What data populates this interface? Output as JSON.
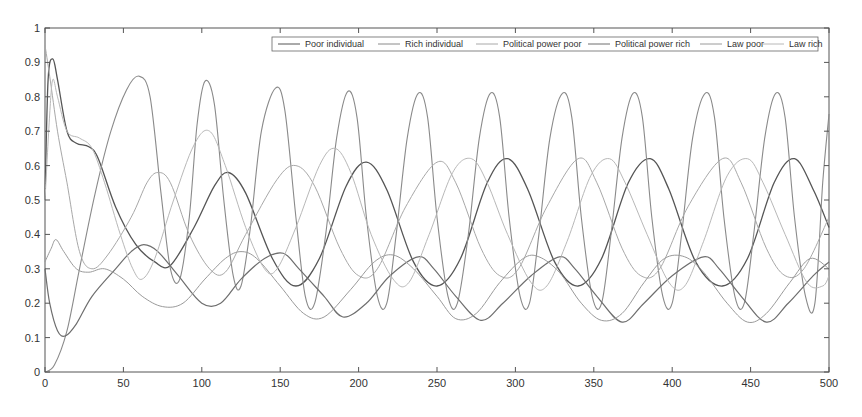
{
  "chart_data": {
    "type": "line",
    "title": "",
    "xlabel": "",
    "ylabel": "",
    "xlim": [
      0,
      500
    ],
    "ylim": [
      0,
      1
    ],
    "x_ticks": [
      0,
      50,
      100,
      150,
      200,
      250,
      300,
      350,
      400,
      450,
      500
    ],
    "y_ticks": [
      0,
      0.1,
      0.2,
      0.3,
      0.4,
      0.5,
      0.6,
      0.7,
      0.8,
      0.9,
      1
    ],
    "grid": false,
    "legend_position": "top-right (horizontal)",
    "series": [
      {
        "name": "Poor individual",
        "color": "#555555",
        "width": 1.3,
        "dash": "",
        "points": [
          [
            0,
            0.5
          ],
          [
            2,
            0.85
          ],
          [
            5,
            0.91
          ],
          [
            8,
            0.85
          ],
          [
            14,
            0.7
          ],
          [
            20,
            0.665
          ],
          [
            28,
            0.655
          ],
          [
            34,
            0.62
          ],
          [
            45,
            0.48
          ],
          [
            58,
            0.37
          ],
          [
            70,
            0.32
          ],
          [
            80,
            0.31
          ],
          [
            95,
            0.42
          ],
          [
            108,
            0.54
          ],
          [
            117,
            0.58
          ],
          [
            128,
            0.52
          ],
          [
            145,
            0.33
          ],
          [
            160,
            0.25
          ],
          [
            175,
            0.33
          ],
          [
            192,
            0.54
          ],
          [
            205,
            0.61
          ],
          [
            218,
            0.53
          ],
          [
            235,
            0.32
          ],
          [
            250,
            0.25
          ],
          [
            265,
            0.33
          ],
          [
            282,
            0.55
          ],
          [
            295,
            0.62
          ],
          [
            308,
            0.53
          ],
          [
            325,
            0.32
          ],
          [
            340,
            0.25
          ],
          [
            355,
            0.33
          ],
          [
            372,
            0.55
          ],
          [
            386,
            0.62
          ],
          [
            398,
            0.53
          ],
          [
            415,
            0.32
          ],
          [
            432,
            0.25
          ],
          [
            448,
            0.33
          ],
          [
            465,
            0.55
          ],
          [
            478,
            0.62
          ],
          [
            490,
            0.53
          ],
          [
            500,
            0.42
          ]
        ]
      },
      {
        "name": "Rich individual",
        "color": "#8a8a8a",
        "width": 1.1,
        "dash": "",
        "points": [
          [
            0,
            0.0
          ],
          [
            6,
            0.02
          ],
          [
            14,
            0.12
          ],
          [
            22,
            0.3
          ],
          [
            32,
            0.52
          ],
          [
            42,
            0.7
          ],
          [
            52,
            0.82
          ],
          [
            60,
            0.86
          ],
          [
            67,
            0.8
          ],
          [
            74,
            0.52
          ],
          [
            80,
            0.3
          ],
          [
            86,
            0.27
          ],
          [
            92,
            0.45
          ],
          [
            97,
            0.72
          ],
          [
            102,
            0.845
          ],
          [
            108,
            0.78
          ],
          [
            114,
            0.5
          ],
          [
            120,
            0.28
          ],
          [
            125,
            0.25
          ],
          [
            131,
            0.42
          ],
          [
            138,
            0.7
          ],
          [
            147,
            0.825
          ],
          [
            153,
            0.76
          ],
          [
            160,
            0.45
          ],
          [
            166,
            0.22
          ],
          [
            172,
            0.2
          ],
          [
            179,
            0.4
          ],
          [
            186,
            0.68
          ],
          [
            193,
            0.815
          ],
          [
            199,
            0.74
          ],
          [
            205,
            0.45
          ],
          [
            212,
            0.22
          ],
          [
            218,
            0.2
          ],
          [
            224,
            0.4
          ],
          [
            231,
            0.68
          ],
          [
            238,
            0.81
          ],
          [
            244,
            0.74
          ],
          [
            250,
            0.45
          ],
          [
            257,
            0.22
          ],
          [
            263,
            0.2
          ],
          [
            270,
            0.4
          ],
          [
            277,
            0.68
          ],
          [
            284,
            0.81
          ],
          [
            290,
            0.74
          ],
          [
            296,
            0.45
          ],
          [
            303,
            0.22
          ],
          [
            309,
            0.2
          ],
          [
            315,
            0.4
          ],
          [
            322,
            0.68
          ],
          [
            330,
            0.81
          ],
          [
            336,
            0.74
          ],
          [
            342,
            0.45
          ],
          [
            349,
            0.22
          ],
          [
            355,
            0.2
          ],
          [
            361,
            0.4
          ],
          [
            368,
            0.68
          ],
          [
            375,
            0.81
          ],
          [
            381,
            0.74
          ],
          [
            387,
            0.45
          ],
          [
            394,
            0.22
          ],
          [
            400,
            0.2
          ],
          [
            406,
            0.4
          ],
          [
            413,
            0.68
          ],
          [
            421,
            0.81
          ],
          [
            427,
            0.74
          ],
          [
            433,
            0.45
          ],
          [
            440,
            0.22
          ],
          [
            446,
            0.2
          ],
          [
            452,
            0.4
          ],
          [
            459,
            0.68
          ],
          [
            466,
            0.81
          ],
          [
            472,
            0.74
          ],
          [
            478,
            0.45
          ],
          [
            485,
            0.22
          ],
          [
            491,
            0.2
          ],
          [
            496,
            0.55
          ],
          [
            500,
            0.75
          ]
        ]
      },
      {
        "name": "Political power poor",
        "color": "#a8a8a8",
        "width": 1.0,
        "dash": "",
        "points": [
          [
            0,
            0.95
          ],
          [
            3,
            0.86
          ],
          [
            8,
            0.7
          ],
          [
            14,
            0.55
          ],
          [
            22,
            0.35
          ],
          [
            30,
            0.3
          ],
          [
            40,
            0.34
          ],
          [
            55,
            0.45
          ],
          [
            65,
            0.55
          ],
          [
            72,
            0.58
          ],
          [
            80,
            0.55
          ],
          [
            92,
            0.4
          ],
          [
            105,
            0.3
          ],
          [
            115,
            0.29
          ],
          [
            128,
            0.4
          ],
          [
            148,
            0.56
          ],
          [
            160,
            0.6
          ],
          [
            172,
            0.54
          ],
          [
            188,
            0.36
          ],
          [
            200,
            0.28
          ],
          [
            212,
            0.3
          ],
          [
            230,
            0.48
          ],
          [
            250,
            0.61
          ],
          [
            262,
            0.55
          ],
          [
            278,
            0.36
          ],
          [
            290,
            0.28
          ],
          [
            302,
            0.3
          ],
          [
            320,
            0.48
          ],
          [
            340,
            0.62
          ],
          [
            352,
            0.55
          ],
          [
            368,
            0.36
          ],
          [
            380,
            0.28
          ],
          [
            392,
            0.3
          ],
          [
            410,
            0.48
          ],
          [
            432,
            0.62
          ],
          [
            444,
            0.55
          ],
          [
            460,
            0.36
          ],
          [
            472,
            0.28
          ],
          [
            484,
            0.3
          ],
          [
            500,
            0.45
          ]
        ]
      },
      {
        "name": "Political power rich",
        "color": "#6e6e6e",
        "width": 1.2,
        "dash": "",
        "points": [
          [
            0,
            0.3
          ],
          [
            3,
            0.2
          ],
          [
            8,
            0.12
          ],
          [
            13,
            0.105
          ],
          [
            20,
            0.14
          ],
          [
            30,
            0.22
          ],
          [
            45,
            0.3
          ],
          [
            55,
            0.35
          ],
          [
            63,
            0.37
          ],
          [
            72,
            0.35
          ],
          [
            85,
            0.28
          ],
          [
            100,
            0.2
          ],
          [
            112,
            0.2
          ],
          [
            125,
            0.27
          ],
          [
            140,
            0.33
          ],
          [
            152,
            0.345
          ],
          [
            162,
            0.3
          ],
          [
            178,
            0.22
          ],
          [
            190,
            0.16
          ],
          [
            205,
            0.2
          ],
          [
            220,
            0.28
          ],
          [
            238,
            0.335
          ],
          [
            248,
            0.3
          ],
          [
            262,
            0.22
          ],
          [
            278,
            0.15
          ],
          [
            292,
            0.2
          ],
          [
            310,
            0.28
          ],
          [
            328,
            0.335
          ],
          [
            338,
            0.3
          ],
          [
            352,
            0.22
          ],
          [
            368,
            0.145
          ],
          [
            382,
            0.2
          ],
          [
            400,
            0.28
          ],
          [
            420,
            0.335
          ],
          [
            430,
            0.3
          ],
          [
            444,
            0.22
          ],
          [
            460,
            0.145
          ],
          [
            474,
            0.2
          ],
          [
            490,
            0.28
          ],
          [
            500,
            0.32
          ]
        ]
      },
      {
        "name": "Law poor",
        "color": "#9a9a9a",
        "width": 1.0,
        "dash": "",
        "points": [
          [
            0,
            0.32
          ],
          [
            4,
            0.36
          ],
          [
            7,
            0.385
          ],
          [
            12,
            0.35
          ],
          [
            20,
            0.3
          ],
          [
            28,
            0.29
          ],
          [
            38,
            0.3
          ],
          [
            50,
            0.27
          ],
          [
            62,
            0.22
          ],
          [
            75,
            0.19
          ],
          [
            88,
            0.2
          ],
          [
            102,
            0.27
          ],
          [
            115,
            0.33
          ],
          [
            125,
            0.35
          ],
          [
            135,
            0.33
          ],
          [
            150,
            0.25
          ],
          [
            165,
            0.17
          ],
          [
            178,
            0.16
          ],
          [
            195,
            0.24
          ],
          [
            210,
            0.32
          ],
          [
            222,
            0.34
          ],
          [
            235,
            0.3
          ],
          [
            250,
            0.22
          ],
          [
            262,
            0.155
          ],
          [
            275,
            0.17
          ],
          [
            290,
            0.26
          ],
          [
            305,
            0.33
          ],
          [
            315,
            0.335
          ],
          [
            328,
            0.29
          ],
          [
            342,
            0.2
          ],
          [
            355,
            0.15
          ],
          [
            368,
            0.17
          ],
          [
            382,
            0.26
          ],
          [
            395,
            0.33
          ],
          [
            408,
            0.335
          ],
          [
            420,
            0.29
          ],
          [
            435,
            0.2
          ],
          [
            448,
            0.145
          ],
          [
            460,
            0.17
          ],
          [
            475,
            0.26
          ],
          [
            488,
            0.33
          ],
          [
            500,
            0.3
          ]
        ]
      },
      {
        "name": "Law rich",
        "color": "#b8b8b8",
        "width": 1.0,
        "dash": "",
        "points": [
          [
            0,
            0.5
          ],
          [
            3,
            0.75
          ],
          [
            5,
            0.85
          ],
          [
            8,
            0.8
          ],
          [
            14,
            0.7
          ],
          [
            22,
            0.68
          ],
          [
            30,
            0.65
          ],
          [
            38,
            0.55
          ],
          [
            48,
            0.4
          ],
          [
            56,
            0.3
          ],
          [
            62,
            0.27
          ],
          [
            70,
            0.33
          ],
          [
            82,
            0.5
          ],
          [
            95,
            0.66
          ],
          [
            105,
            0.7
          ],
          [
            115,
            0.6
          ],
          [
            128,
            0.42
          ],
          [
            140,
            0.3
          ],
          [
            148,
            0.3
          ],
          [
            160,
            0.42
          ],
          [
            175,
            0.6
          ],
          [
            185,
            0.65
          ],
          [
            195,
            0.58
          ],
          [
            208,
            0.4
          ],
          [
            222,
            0.27
          ],
          [
            232,
            0.26
          ],
          [
            245,
            0.4
          ],
          [
            260,
            0.58
          ],
          [
            272,
            0.62
          ],
          [
            282,
            0.55
          ],
          [
            295,
            0.4
          ],
          [
            310,
            0.26
          ],
          [
            320,
            0.25
          ],
          [
            333,
            0.38
          ],
          [
            348,
            0.57
          ],
          [
            360,
            0.62
          ],
          [
            370,
            0.55
          ],
          [
            384,
            0.4
          ],
          [
            398,
            0.26
          ],
          [
            408,
            0.25
          ],
          [
            420,
            0.38
          ],
          [
            435,
            0.57
          ],
          [
            448,
            0.62
          ],
          [
            458,
            0.55
          ],
          [
            472,
            0.4
          ],
          [
            486,
            0.26
          ],
          [
            496,
            0.25
          ],
          [
            500,
            0.28
          ]
        ]
      }
    ]
  },
  "axes": {
    "x_tick_labels": [
      "0",
      "50",
      "100",
      "150",
      "200",
      "250",
      "300",
      "350",
      "400",
      "450",
      "500"
    ],
    "y_tick_labels": [
      "0",
      "0.1",
      "0.2",
      "0.3",
      "0.4",
      "0.5",
      "0.6",
      "0.7",
      "0.8",
      "0.9",
      "1"
    ]
  },
  "legend": {
    "items": [
      "Poor individual",
      "Rich individual",
      "Political power poor",
      "Political power rich",
      "Law poor",
      "Law rich"
    ]
  }
}
